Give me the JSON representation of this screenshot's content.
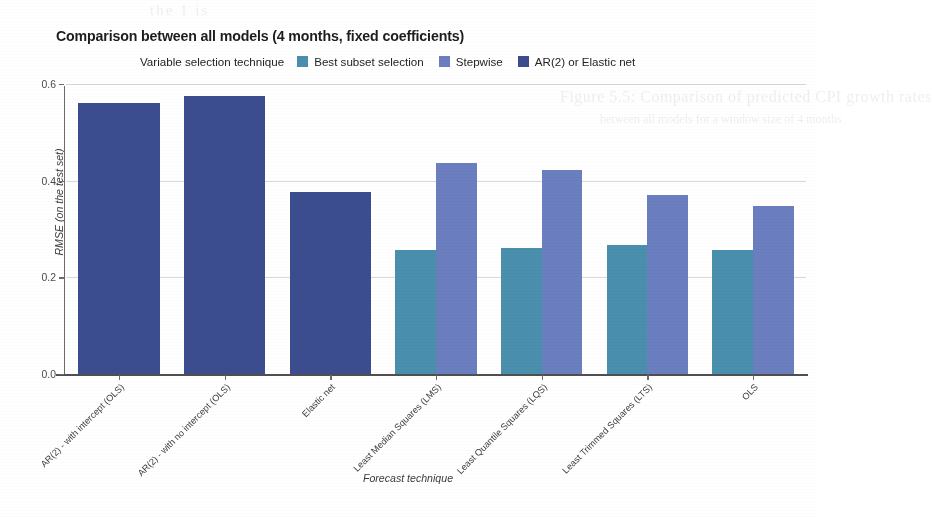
{
  "chart_data": {
    "type": "bar",
    "title": "Comparison between all models (4 months, fixed coefficients)",
    "xlabel": "Forecast technique",
    "ylabel": "RMSE (on the test set)",
    "grouped": true,
    "grid": true,
    "legend_position": "top",
    "legend_title": "Variable selection technique",
    "ylim": [
      0.0,
      0.6
    ],
    "yticks": [
      "0.0",
      "0.2",
      "0.4",
      "0.6"
    ],
    "ytick_values": [
      0.0,
      0.2,
      0.4,
      0.6
    ],
    "categories": [
      "AR(2) - with intercept (OLS)",
      "AR(2) - with no intercept (OLS)",
      "Elastic net",
      "Least Median Squares (LMS)",
      "Least Quantile Squares (LQS)",
      "Least Trimmed Squares (LTS)",
      "OLS"
    ],
    "series": [
      {
        "name": "Best subset selection",
        "color": "#4a8fad",
        "values": [
          null,
          null,
          null,
          0.256,
          0.26,
          0.266,
          0.256
        ]
      },
      {
        "name": "Stepwise",
        "color": "#6a7ec0",
        "values": [
          null,
          null,
          null,
          0.436,
          0.422,
          0.37,
          0.347
        ]
      },
      {
        "name": "AR(2) or Elastic net",
        "color": "#3c4d8f",
        "values": [
          0.56,
          0.575,
          0.376,
          null,
          null,
          null,
          null
        ]
      }
    ]
  },
  "artifacts": {
    "bleed_top": "the 1 is",
    "bleed_mid": "Figure 5.5: Comparison of predicted CPI growth rates",
    "bleed_mid2": "between all models for a window size of 4 months"
  }
}
